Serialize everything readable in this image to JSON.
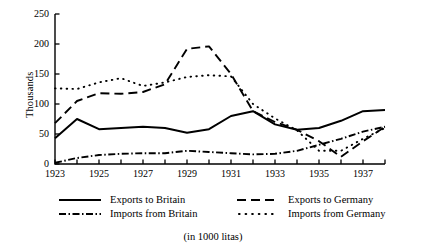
{
  "figure": {
    "caption": "(in 1000 litas)",
    "y_axis_title": "Thousands"
  },
  "chart_data": {
    "type": "line",
    "title": "",
    "subtitle": "",
    "xlabel": "",
    "ylabel": "Thousands",
    "annotation": "(in 1000 litas)",
    "units": "1000 litas",
    "grid": false,
    "legend_position": "bottom",
    "xlim": [
      1923,
      1938
    ],
    "ylim": [
      0,
      250
    ],
    "ytick_values": [
      0,
      50,
      100,
      150,
      200,
      250
    ],
    "ytick_labels": [
      "0",
      "50",
      "100",
      "150",
      "200",
      "250"
    ],
    "x": [
      1923,
      1924,
      1925,
      1926,
      1927,
      1928,
      1929,
      1930,
      1931,
      1932,
      1933,
      1934,
      1935,
      1936,
      1937,
      1938
    ],
    "xtick_values": [
      1923,
      1924,
      1925,
      1926,
      1927,
      1928,
      1929,
      1930,
      1931,
      1932,
      1933,
      1934,
      1935,
      1936,
      1937,
      1938
    ],
    "xtick_labels": [
      "1923",
      "",
      "1925",
      "",
      "1927",
      "",
      "1929",
      "",
      "1931",
      "",
      "1933",
      "",
      "1935",
      "",
      "1937",
      ""
    ],
    "series": [
      {
        "name": "Exports to Britain",
        "style": "solid",
        "color": "#000000",
        "values": [
          43,
          75,
          58,
          60,
          62,
          60,
          52,
          58,
          80,
          88,
          66,
          57,
          60,
          72,
          88,
          90
        ]
      },
      {
        "name": "Imports from Britain",
        "style": "dash-dot",
        "color": "#000000",
        "values": [
          2,
          10,
          15,
          17,
          18,
          18,
          22,
          20,
          18,
          16,
          17,
          22,
          32,
          42,
          54,
          62
        ]
      },
      {
        "name": "Exports to Germany",
        "style": "dashed",
        "color": "#000000",
        "values": [
          68,
          105,
          118,
          117,
          120,
          133,
          192,
          196,
          150,
          88,
          70,
          57,
          38,
          12,
          38,
          62
        ]
      },
      {
        "name": "Imports from Germany",
        "style": "dotted",
        "color": "#000000",
        "values": [
          126,
          125,
          136,
          143,
          130,
          136,
          145,
          148,
          146,
          100,
          76,
          56,
          22,
          22,
          42,
          60
        ]
      }
    ]
  },
  "legend": {
    "entries": [
      {
        "label": "Exports to Britain",
        "style": "solid"
      },
      {
        "label": "Exports to Germany",
        "style": "dashed"
      },
      {
        "label": "Imports from Britain",
        "style": "dash-dot"
      },
      {
        "label": "Imports from Germany",
        "style": "dotted"
      }
    ]
  }
}
